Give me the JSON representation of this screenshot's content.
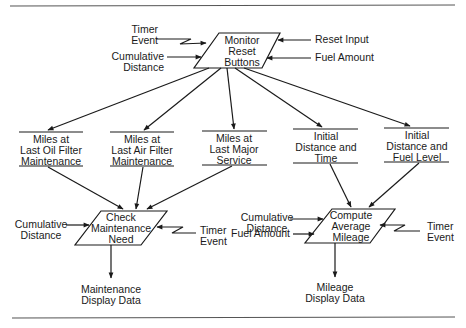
{
  "diagram": {
    "processes": {
      "monitor": "Monitor\nReset\nButtons",
      "check": "Check\nMaintenance\nNeed",
      "compute": "Compute\nAverage\nMileage"
    },
    "stores": {
      "oil": "Miles at\nLast Oil Filter\nMaintenance",
      "air": "Miles at\nLast Air Filter\nMaintenance",
      "major": "Miles at\nLast Major\nService",
      "time": "Initial\nDistance and\nTime",
      "fuel": "Initial\nDistance and\nFuel Level"
    },
    "inputs": {
      "monitor_timer": "Timer\nEvent",
      "monitor_distance": "Cumulative\nDistance",
      "monitor_reset": "Reset Input",
      "monitor_fuel": "Fuel Amount",
      "check_distance": "Cumulative\nDistance",
      "check_timer": "Timer\nEvent",
      "compute_distance": "Cumulative\nDistance",
      "compute_fuel": "Fuel Amount",
      "compute_timer": "Timer\nEvent"
    },
    "outputs": {
      "maintenance": "Maintenance\nDisplay Data",
      "mileage": "Mileage\nDisplay Data"
    },
    "colors": {
      "ink": "#1a1a1a",
      "rule": "#555555",
      "background": "#ffffff"
    }
  }
}
